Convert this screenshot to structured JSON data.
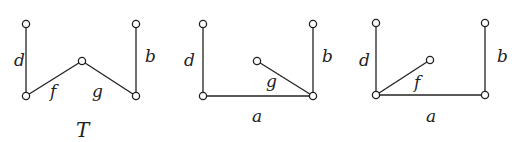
{
  "diagrams": [
    {
      "name": "tree-T",
      "caption": "T",
      "nodes": [
        [
          26,
          24
        ],
        [
          26,
          96
        ],
        [
          82,
          61
        ],
        [
          136,
          24
        ],
        [
          136,
          96
        ]
      ],
      "edges": [
        {
          "from": 0,
          "to": 1,
          "label": "d",
          "lx": 14,
          "ly": 66
        },
        {
          "from": 1,
          "to": 2,
          "label": "f",
          "lx": 50,
          "ly": 97
        },
        {
          "from": 2,
          "to": 4,
          "label": "g",
          "lx": 92,
          "ly": 97
        },
        {
          "from": 3,
          "to": 4,
          "label": "b",
          "lx": 145,
          "ly": 62
        }
      ]
    },
    {
      "name": "tree-2",
      "caption": "",
      "nodes": [
        [
          203,
          24
        ],
        [
          203,
          96
        ],
        [
          257,
          61
        ],
        [
          313,
          24
        ],
        [
          313,
          96
        ]
      ],
      "edges": [
        {
          "from": 0,
          "to": 1,
          "label": "d",
          "lx": 184,
          "ly": 66
        },
        {
          "from": 1,
          "to": 4,
          "label": "a",
          "lx": 252,
          "ly": 122
        },
        {
          "from": 2,
          "to": 4,
          "label": "g",
          "lx": 266,
          "ly": 87
        },
        {
          "from": 3,
          "to": 4,
          "label": "b",
          "lx": 322,
          "ly": 62
        }
      ]
    },
    {
      "name": "tree-3",
      "caption": "",
      "nodes": [
        [
          376,
          23
        ],
        [
          376,
          95
        ],
        [
          430,
          60
        ],
        [
          485,
          23
        ],
        [
          485,
          95
        ]
      ],
      "edges": [
        {
          "from": 0,
          "to": 1,
          "label": "d",
          "lx": 359,
          "ly": 66
        },
        {
          "from": 1,
          "to": 2,
          "label": "f",
          "lx": 414,
          "ly": 88
        },
        {
          "from": 1,
          "to": 4,
          "label": "a",
          "lx": 426,
          "ly": 122
        },
        {
          "from": 3,
          "to": 4,
          "label": "b",
          "lx": 497,
          "ly": 62
        }
      ]
    }
  ],
  "caption_position": {
    "x": 76,
    "y": 137
  }
}
